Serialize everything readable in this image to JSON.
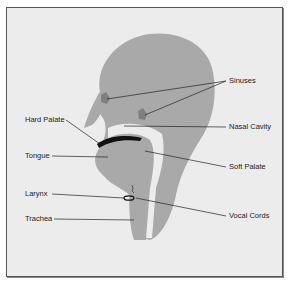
{
  "diagram": {
    "title": "",
    "colors": {
      "background": "#ececec",
      "border": "#555555",
      "tissue": "#a9a9a9",
      "sinus": "#7f7f7f",
      "leader_line": "#222222",
      "palate": "#111111"
    },
    "labels": {
      "sinuses": "Sinuses",
      "nasal_cavity": "Nasal Cavity",
      "hard_palate": "Hard Palate",
      "soft_palate": "Soft Palate",
      "tongue": "Tongue",
      "larynx": "Larynx",
      "trachea": "Trachea",
      "vocal_cords": "Vocal Cords"
    }
  }
}
